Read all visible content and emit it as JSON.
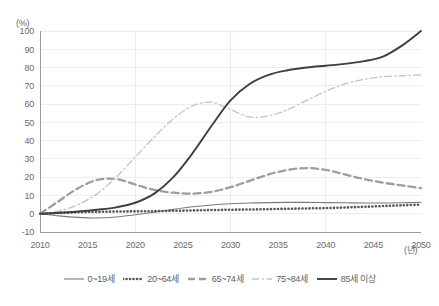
{
  "chart_data": {
    "type": "line",
    "title": "",
    "subtitle": "",
    "xlabel": "(년)",
    "ylabel": "(%)",
    "xlim": [
      2010,
      2050
    ],
    "ylim": [
      -10,
      100
    ],
    "grid": true,
    "legend_position": "bottom",
    "x_ticks": [
      "2010",
      "2015",
      "2020",
      "2025",
      "2030",
      "2035",
      "2040",
      "2045",
      "2050"
    ],
    "x_tick_values": [
      2010,
      2015,
      2020,
      2025,
      2030,
      2035,
      2040,
      2045,
      2050
    ],
    "y_ticks": [
      "-10",
      "0",
      "10",
      "20",
      "30",
      "40",
      "50",
      "60",
      "70",
      "80",
      "90",
      "100"
    ],
    "y_tick_values": [
      -10,
      0,
      10,
      20,
      30,
      40,
      50,
      60,
      70,
      80,
      90,
      100
    ],
    "x": [
      2010,
      2012,
      2014,
      2016,
      2018,
      2020,
      2022,
      2024,
      2026,
      2028,
      2030,
      2032,
      2034,
      2036,
      2038,
      2040,
      2042,
      2044,
      2046,
      2048,
      2050
    ],
    "series": [
      {
        "name": "0~19세",
        "style": "solid-thin",
        "color": "#7a7a7a",
        "values": [
          0,
          -1.2,
          -2.0,
          -2.3,
          -1.8,
          -0.6,
          0.8,
          2.4,
          3.8,
          4.8,
          5.5,
          5.9,
          6.1,
          6.2,
          6.2,
          6.1,
          6.0,
          5.9,
          5.9,
          6.0,
          6.3
        ]
      },
      {
        "name": "20~64세",
        "style": "dotted",
        "color": "#595959",
        "values": [
          0,
          0.4,
          0.8,
          1.0,
          1.2,
          1.3,
          1.4,
          1.6,
          1.8,
          2.0,
          2.2,
          2.3,
          2.5,
          2.7,
          2.9,
          3.1,
          3.4,
          3.8,
          4.2,
          4.6,
          5.0
        ]
      },
      {
        "name": "65~74세",
        "style": "dashed",
        "color": "#9e9e9e",
        "values": [
          0,
          7.0,
          14.0,
          18.5,
          19.0,
          16.0,
          13.0,
          11.5,
          11.0,
          12.0,
          14.5,
          18.0,
          21.5,
          24.0,
          25.0,
          24.0,
          21.5,
          19.0,
          17.0,
          15.5,
          14.0
        ]
      },
      {
        "name": "75~84세",
        "style": "dashdot",
        "color": "#c3c3c3",
        "values": [
          0,
          1.5,
          5.0,
          11.0,
          20.0,
          31.0,
          42.0,
          52.0,
          59.0,
          61.0,
          57.0,
          53.0,
          53.5,
          57.0,
          62.0,
          67.0,
          71.0,
          73.5,
          75.0,
          75.5,
          76.0
        ]
      },
      {
        "name": "85세 이상",
        "style": "solid-thick",
        "color": "#3f3f3f",
        "values": [
          0,
          0.5,
          1.2,
          2.2,
          3.5,
          6.0,
          11.0,
          20.0,
          33.0,
          48.0,
          62.0,
          71.0,
          76.0,
          78.5,
          80.0,
          81.0,
          82.0,
          83.5,
          86.0,
          92.0,
          100.0
        ]
      }
    ]
  },
  "legend": {
    "items": [
      {
        "label": "0~19세",
        "swatch": "solid-thin-swatch"
      },
      {
        "label": "20~64세",
        "swatch": "dotted-swatch"
      },
      {
        "label": "65~74세",
        "swatch": "dashed-swatch"
      },
      {
        "label": "75~84세",
        "swatch": "dashdot-swatch"
      },
      {
        "label": "85세 이상",
        "swatch": "solid-thick-swatch"
      }
    ]
  }
}
